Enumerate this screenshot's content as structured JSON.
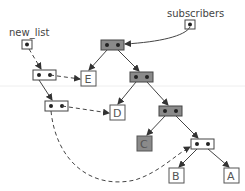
{
  "labels": {
    "new_list": "new_list",
    "subscribers": "subscribers"
  },
  "leaves": {
    "E": "E",
    "D": "D",
    "C": "C",
    "B": "B",
    "A": "A"
  },
  "colors": {
    "shared_node_fill": "#8a8a8a",
    "new_node_fill": "#ffffff",
    "stroke": "#444444",
    "dot": "#222222"
  }
}
